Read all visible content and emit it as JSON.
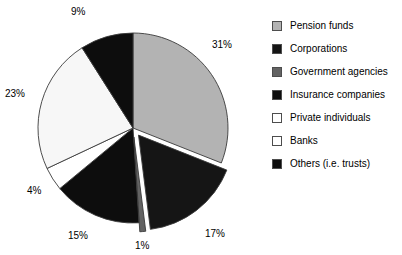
{
  "chart_data": {
    "type": "pie",
    "title": "",
    "subtitle": "",
    "xlabel": "",
    "ylabel": "",
    "legend_position": "right",
    "grid": false,
    "start_angle_deg": 0,
    "direction": "clockwise",
    "categories": [
      "Pension funds",
      "Corporations",
      "Government agencies",
      "Insurance companies",
      "Private individuals",
      "Banks",
      "Others (i.e. trusts)"
    ],
    "values": [
      31,
      17,
      1,
      15,
      4,
      23,
      9
    ],
    "value_labels": [
      "31%",
      "17%",
      "1%",
      "15%",
      "4%",
      "23%",
      "9%"
    ],
    "colors": [
      "#b3b3b3",
      "#151515",
      "#636363",
      "#0d0d0d",
      "#ffffff",
      "#f7f7f7",
      "#0d0d0d"
    ],
    "exploded": [
      false,
      true,
      true,
      false,
      false,
      false,
      false
    ],
    "slices": [
      {
        "label": "Pension funds",
        "value": 31,
        "value_label": "31%",
        "color": "#b3b3b3",
        "exploded": false
      },
      {
        "label": "Corporations",
        "value": 17,
        "value_label": "17%",
        "color": "#151515",
        "exploded": true
      },
      {
        "label": "Government agencies",
        "value": 1,
        "value_label": "1%",
        "color": "#636363",
        "exploded": true
      },
      {
        "label": "Insurance companies",
        "value": 15,
        "value_label": "15%",
        "color": "#0d0d0d",
        "exploded": false
      },
      {
        "label": "Private individuals",
        "value": 4,
        "value_label": "4%",
        "color": "#ffffff",
        "exploded": false
      },
      {
        "label": "Banks",
        "value": 23,
        "value_label": "23%",
        "color": "#f7f7f7",
        "exploded": false
      },
      {
        "label": "Others (i.e. trusts)",
        "value": 9,
        "value_label": "9%",
        "color": "#0d0d0d",
        "exploded": false
      }
    ]
  },
  "pie": {
    "labels": {
      "pension_funds": "31%",
      "corporations": "17%",
      "government_agencies": "1%",
      "insurance_companies": "15%",
      "private_individuals": "4%",
      "banks": "23%",
      "others": "9%"
    }
  },
  "legend": {
    "items": [
      {
        "label": "Pension funds",
        "color": "#b3b3b3"
      },
      {
        "label": "Corporations",
        "color": "#151515"
      },
      {
        "label": "Government agencies",
        "color": "#636363"
      },
      {
        "label": "Insurance companies",
        "color": "#0d0d0d"
      },
      {
        "label": "Private individuals",
        "color": "#ffffff"
      },
      {
        "label": "Banks",
        "color": "#ffffff"
      },
      {
        "label": "Others (i.e. trusts)",
        "color": "#0d0d0d"
      }
    ]
  }
}
